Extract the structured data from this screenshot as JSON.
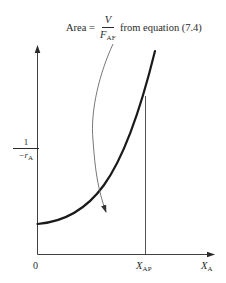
{
  "diagram": {
    "type": "levenspiel-plot",
    "annotation": {
      "prefix": "Area = ",
      "fraction_numerator": "V",
      "fraction_denominator_symbol": "F",
      "fraction_denominator_subscript": "AF",
      "suffix": "from equation (7.4)"
    },
    "y_axis": {
      "label_numerator": "1",
      "label_denominator_symbol": "−r",
      "label_denominator_subscript": "A"
    },
    "x_axis": {
      "origin_label": "0",
      "marker_symbol": "X",
      "marker_subscript": "AP",
      "axis_symbol": "X",
      "axis_subscript": "A"
    },
    "colors": {
      "curve": "#1a1a1a",
      "axes": "#2a2a2a",
      "annotation_arrow": "#555555",
      "background": "#ffffff"
    }
  }
}
